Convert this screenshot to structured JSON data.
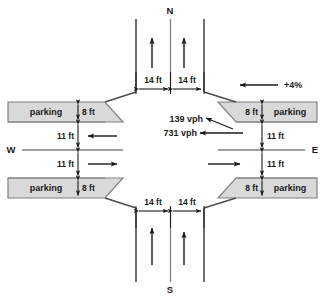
{
  "diagram": {
    "compass": {
      "north": "N",
      "south": "S",
      "east": "E",
      "west": "W"
    },
    "colors": {
      "line": "#4d4d4d",
      "arrow": "#1a1a1a",
      "parking_fill": "#d9d9d9",
      "parking_stroke": "#808080",
      "text": "#1a1a1a",
      "background": "#ffffff"
    },
    "lane_widths": {
      "north_left": "14 ft",
      "north_right": "14 ft",
      "south_left": "14 ft",
      "south_right": "14 ft",
      "west_upper": "11 ft",
      "west_lower": "11 ft",
      "east_upper": "11 ft",
      "east_lower": "11 ft"
    },
    "parking_lanes": [
      {
        "id": "nw",
        "label": "parking",
        "width": "8 ft"
      },
      {
        "id": "ne",
        "label": "parking",
        "width": "8 ft"
      },
      {
        "id": "sw",
        "label": "parking",
        "width": "8 ft"
      },
      {
        "id": "se",
        "label": "parking",
        "width": "8 ft"
      }
    ],
    "volumes": [
      {
        "id": "left-turn",
        "value": "139 vph"
      },
      {
        "id": "through",
        "value": "731 vph"
      }
    ],
    "grade": {
      "label": "+4%"
    }
  }
}
